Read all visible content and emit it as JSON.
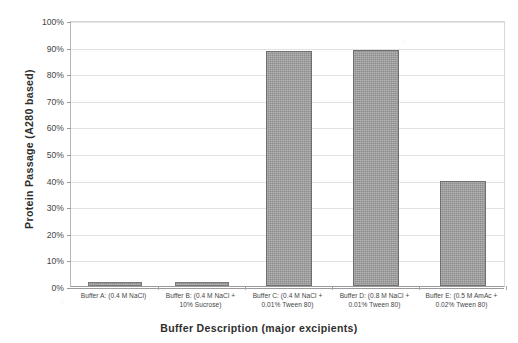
{
  "chart_data": {
    "type": "bar",
    "title": "",
    "xlabel": "Buffer Description (major excipients)",
    "ylabel": "Protein Passage (A280 based)",
    "ylim": [
      0,
      100
    ],
    "yunit": "%",
    "grid": true,
    "legend": "none",
    "categories": [
      "Buffer A: (0.4 M NaCl)",
      "Buffer B: (0.4 M NaCl + 10% Sucrose)",
      "Buffer C: (0.4 M NaCl + 0.01% Tween 80)",
      "Buffer D: (0.8 M NaCl + 0.01% Tween 80)",
      "Buffer E: (0.5 M AmAc + 0.02% Tween 80)"
    ],
    "category_lines": [
      [
        "Buffer A: (0.4 M NaCl)",
        ""
      ],
      [
        "Buffer B: (0.4 M NaCl +",
        "10% Sucrose)"
      ],
      [
        "Buffer C: (0.4 M NaCl +",
        "0.01% Tween 80)"
      ],
      [
        "Buffer D: (0.8 M NaCl +",
        "0.01% Tween 80)"
      ],
      [
        "Buffer E: (0.5 M AmAc +",
        "0.02% Tween 80)"
      ]
    ],
    "values": [
      1.5,
      1.6,
      88.5,
      88.7,
      39.6
    ],
    "ytick_labels": [
      "100%",
      "90%",
      "80%",
      "70%",
      "60%",
      "50%",
      "40%",
      "30%",
      "20%",
      "10%",
      "0%"
    ],
    "ytick_values": [
      100,
      90,
      80,
      70,
      60,
      50,
      40,
      30,
      20,
      10,
      0
    ],
    "bar_color": "#9c9c9c",
    "bar_border_color": "#6f6f6f",
    "gridline_color": "#e2e2e2",
    "axis_color": "#9b9b9b"
  }
}
